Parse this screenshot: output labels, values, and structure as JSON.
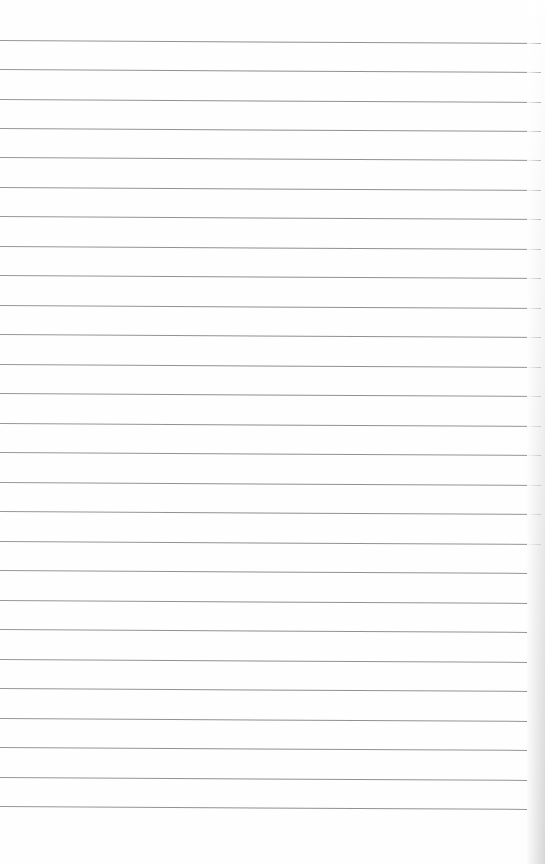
{
  "page": {
    "type": "lined-paper",
    "background_color": "#fefefe",
    "rule_color": "#888888",
    "rule_count": 27,
    "rules_y_left": [
      40,
      69,
      99,
      128,
      157,
      187,
      216,
      246,
      275,
      305,
      334,
      364,
      393,
      423,
      452,
      482,
      511,
      541,
      570,
      600,
      629,
      659,
      688,
      718,
      747,
      777,
      806
    ],
    "rule_slope_px": 3,
    "rule_right_end_x": 541,
    "edge_shadow": "right"
  }
}
